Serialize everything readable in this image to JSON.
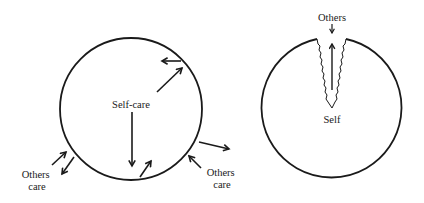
{
  "colors": {
    "ink": "#1a1a1a",
    "background": "#ffffff"
  },
  "left_diagram": {
    "center_label": "Self-care",
    "outer_labels": [
      {
        "line1": "Others",
        "line2": "care"
      },
      {
        "line1": "Others",
        "line2": "care"
      }
    ]
  },
  "right_diagram": {
    "top_label": "Others",
    "center_label": "Self"
  }
}
